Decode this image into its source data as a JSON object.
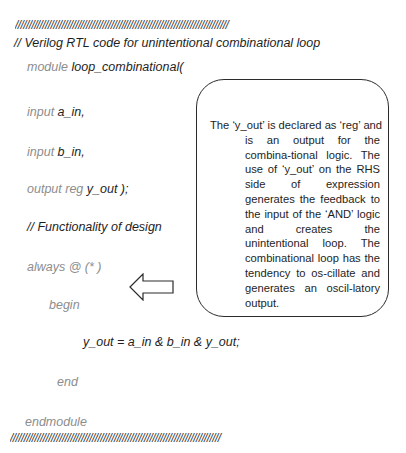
{
  "header": {
    "separator_top": "//////////////////////////////////////////////////////////////////////////////",
    "comment_title": "// Verilog RTL code for unintentional combinational loop"
  },
  "code": {
    "lines": [
      {
        "keyword": "module",
        "identifier": "loop_combinational("
      },
      {
        "keyword": "input",
        "identifier": "a_in,"
      },
      {
        "keyword": "input",
        "identifier": "b_in,"
      },
      {
        "keyword": "output reg",
        "identifier": "y_out );"
      },
      {
        "comment": "// Functionality of design"
      },
      {
        "keyword": "always",
        "identifier": "@ (* )"
      },
      {
        "keyword": "begin"
      },
      {
        "statement": "y_out = a_in  & b_in  & y_out;"
      },
      {
        "keyword": "end"
      },
      {
        "keyword": "endmodule"
      }
    ]
  },
  "footer": {
    "separator_bottom": "/////////////////////////////////////////////////////////////////////////////"
  },
  "callout": {
    "first_line": "The ‘y_out’ is declared as ‘reg’ and",
    "body": "is an output for the combina-tional logic. The use of ‘y_out’ on the RHS side of expression generates the feedback to the input of the ‘AND’ logic and creates the unintentional loop.   The combinational loop has the tendency to os-cillate and generates an oscil-latory output."
  },
  "arrow": {
    "direction": "left",
    "icon": "left-arrow-icon"
  },
  "colors": {
    "keyword": "#8d8d8d",
    "identifier": "#1e1e1e",
    "border": "#2b2b2b"
  }
}
